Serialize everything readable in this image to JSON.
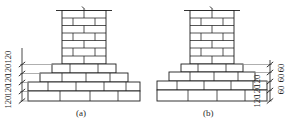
{
  "figure": {
    "kind": "engineering-elevation-drawing",
    "background_color": "#ffffff",
    "line_color": "#1d1d1d",
    "units_note": "mm"
  },
  "panels": [
    {
      "id": "a",
      "caption": "(a)",
      "caption_x": 76,
      "caption_y": 108,
      "pier": {
        "x": 62,
        "y": 10,
        "width": 44,
        "height": 54,
        "courses": 7,
        "break_symbol": "column-break-mark"
      },
      "footing_tiers": [
        {
          "x": 52,
          "y": 64,
          "width": 64,
          "height": 9
        },
        {
          "x": 40,
          "y": 73,
          "width": 88,
          "height": 9
        },
        {
          "x": 28,
          "y": 82,
          "width": 112,
          "height": 9
        },
        {
          "x": 28,
          "y": 91,
          "width": 112,
          "height": 10
        }
      ],
      "dimension_side": "left",
      "dimension_x": 14,
      "dimension_ticks": [
        64,
        73,
        82,
        91,
        101
      ],
      "dimension_labels": [
        {
          "text": "120",
          "x": 14,
          "y": 55
        },
        {
          "text": "120",
          "x": 14,
          "y": 69
        },
        {
          "text": "120",
          "x": 14,
          "y": 78
        },
        {
          "text": "120",
          "x": 14,
          "y": 87
        },
        {
          "text": "120",
          "x": 14,
          "y": 99
        }
      ]
    },
    {
      "id": "b",
      "caption": "(b)",
      "caption_x": 203,
      "caption_y": 108,
      "pier": {
        "x": 190,
        "y": 10,
        "width": 44,
        "height": 54,
        "courses": 7,
        "break_symbol": "column-break-mark"
      },
      "footing_tiers": [
        {
          "x": 181,
          "y": 64,
          "width": 62,
          "height": 8
        },
        {
          "x": 169,
          "y": 72,
          "width": 86,
          "height": 9
        },
        {
          "x": 157,
          "y": 81,
          "width": 110,
          "height": 9
        },
        {
          "x": 157,
          "y": 90,
          "width": 110,
          "height": 11
        }
      ],
      "dimension_side": "right",
      "dimension_x_inner": 262,
      "dimension_x_outer": 280,
      "dimension_ticks": [
        64,
        72,
        81,
        90,
        101
      ],
      "dimension_labels_inner": [
        {
          "text": "120",
          "x": 262,
          "y": 78
        },
        {
          "text": "120",
          "x": 262,
          "y": 87
        },
        {
          "text": "120",
          "x": 262,
          "y": 97
        }
      ],
      "dimension_labels_outer": [
        {
          "text": "60",
          "x": 280,
          "y": 66
        },
        {
          "text": "60",
          "x": 280,
          "y": 74
        },
        {
          "text": "60",
          "x": 280,
          "y": 84
        }
      ]
    }
  ]
}
